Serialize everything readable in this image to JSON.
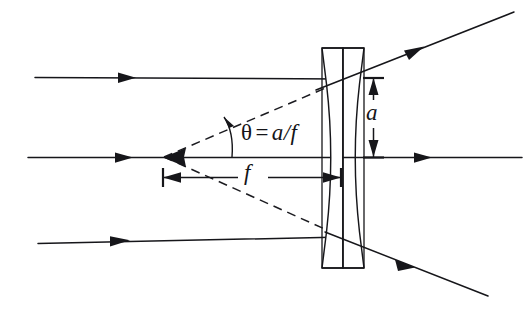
{
  "figure": {
    "background_color": "#ffffff",
    "ink_color": "#16161a",
    "width": 532,
    "height": 315
  },
  "labels": {
    "theta": {
      "name": "theta-equals-a-over-f",
      "theta_symbol": "θ",
      "equals": "=",
      "numerator": "a",
      "slash": "/",
      "denominator": "f",
      "full_text": "θ = a/f"
    },
    "aperture": {
      "name": "ray-height-a",
      "text": "a"
    },
    "focal_length": {
      "name": "focal-length-f",
      "text": "f"
    }
  },
  "optics": {
    "lens_type": "biconcave",
    "optical_axis_y": 157,
    "lens_center_x": 343,
    "lens_top_y": 48,
    "lens_bottom_y": 268,
    "virtual_focus": {
      "x": 163,
      "y": 157
    },
    "incoming_rays": [
      {
        "name": "upper-parallel-ray",
        "y": 77,
        "x_start": 35,
        "x_end": 340
      },
      {
        "name": "axial-ray",
        "y": 157,
        "x_start": 28,
        "x_end": 340
      },
      {
        "name": "lower-parallel-ray",
        "y_start": 243,
        "y_end": 238,
        "x_start": 38,
        "x_end": 340
      }
    ],
    "outgoing_rays": [
      {
        "name": "upper-diverged-ray",
        "x_start": 330,
        "y_start": 85,
        "x_end": 512,
        "y_end": 13
      },
      {
        "name": "axial-transmitted-ray",
        "x_start": 343,
        "y": 157,
        "x_end": 520
      },
      {
        "name": "lower-diverged-ray",
        "x_start": 333,
        "y_start": 238,
        "x_end": 488,
        "y_end": 297
      }
    ],
    "virtual_rays": [
      {
        "name": "upper-virtual-backtrace",
        "x_start": 163,
        "y_start": 157,
        "x_end": 352,
        "y_end": 77
      },
      {
        "name": "lower-virtual-backtrace",
        "x_start": 163,
        "y_start": 157,
        "x_end": 352,
        "y_end": 240
      }
    ],
    "dimensions": [
      {
        "name": "focal-length-dimension",
        "orientation": "horizontal",
        "from_x": 163,
        "to_x": 340,
        "y": 177
      },
      {
        "name": "aperture-dimension",
        "orientation": "vertical",
        "from_y": 77,
        "to_y": 157,
        "x": 373
      }
    ],
    "angle_arc": {
      "name": "theta-angle-arc",
      "vertex_x": 163,
      "vertex_y": 157,
      "marker_x": 232
    }
  }
}
